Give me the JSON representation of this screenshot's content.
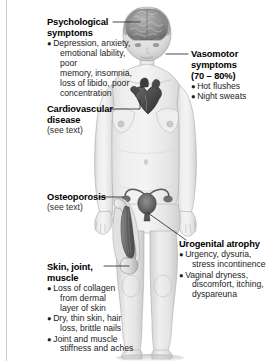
{
  "figure": {
    "colors": {
      "text": "#000000",
      "leader_line": "#2a2a2a",
      "skin": "#e9e9e9",
      "organ_dark": "#565656",
      "page_rule": "#cfcfcf"
    }
  },
  "callouts": {
    "psychological": {
      "heading_line1": "Psychological",
      "heading_line2": "symptoms",
      "items": [
        {
          "line1": "Depression, anxiety,",
          "line2": "emotional lability, poor",
          "line3": "memory, insomnia,",
          "line4": "loss of libido, poor",
          "line5": "concentration"
        }
      ]
    },
    "cardiovascular": {
      "heading_line1": "Cardiovascular",
      "heading_line2": "disease",
      "note": "(see text)"
    },
    "osteoporosis": {
      "heading_line1": "Osteoporosis",
      "note": "(see text)"
    },
    "skin": {
      "heading_line1": "Skin, joint,",
      "heading_line2": "muscle",
      "items": [
        {
          "line1": "Loss of collagen",
          "line2": "from dermal",
          "line3": "layer of skin"
        },
        {
          "line1": "Dry, thin skin, hair",
          "line2": "loss, brittle nails"
        },
        {
          "line1": "Joint and muscle",
          "line2": "stiffness and aches"
        }
      ]
    },
    "vasomotor": {
      "heading_line1": "Vasomotor",
      "heading_line2": "symptoms",
      "heading_line3": "(70 – 80%)",
      "items": [
        {
          "line1": "Hot flushes"
        },
        {
          "line1": "Night sweats"
        }
      ]
    },
    "urogenital": {
      "heading_line1": "Urogenital atrophy",
      "items": [
        {
          "line1": "Urgency, dysuria,",
          "line2": "stress incontinence"
        },
        {
          "line1": "Vaginal dryness,",
          "line2": "discomfort, itching,",
          "line3": "dyspareuna"
        }
      ]
    }
  },
  "anatomy_labels": {
    "brain": "brain-illustration",
    "heart": "heart-illustration",
    "uterus": "uterus-ovaries-illustration",
    "femur": "femur-bone-illustration",
    "thigh_muscle": "thigh-muscle-illustration",
    "body": "female-body-illustration"
  }
}
